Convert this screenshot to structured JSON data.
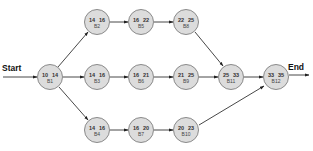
{
  "diagram": {
    "type": "network-diagram",
    "start_label": "Start",
    "end_label": "End",
    "colors": {
      "node_fill": "#dcdcdc",
      "node_stroke": "#8a8a8a",
      "edge": "#333333",
      "text": "#333333"
    },
    "nodes": [
      {
        "id": "B1",
        "left": "10",
        "right": "14",
        "cx": 50,
        "cy": 77
      },
      {
        "id": "B2",
        "left": "14",
        "right": "16",
        "cx": 97,
        "cy": 22
      },
      {
        "id": "B3",
        "left": "14",
        "right": "16",
        "cx": 97,
        "cy": 77
      },
      {
        "id": "B4",
        "left": "14",
        "right": "16",
        "cx": 97,
        "cy": 130
      },
      {
        "id": "B5",
        "left": "16",
        "right": "22",
        "cx": 141,
        "cy": 22
      },
      {
        "id": "B6",
        "left": "16",
        "right": "21",
        "cx": 141,
        "cy": 77
      },
      {
        "id": "B7",
        "left": "16",
        "right": "20",
        "cx": 141,
        "cy": 130
      },
      {
        "id": "B8",
        "left": "22",
        "right": "25",
        "cx": 186,
        "cy": 22
      },
      {
        "id": "B9",
        "left": "21",
        "right": "25",
        "cx": 186,
        "cy": 77
      },
      {
        "id": "B10",
        "left": "20",
        "right": "23",
        "cx": 186,
        "cy": 130
      },
      {
        "id": "B11",
        "left": "25",
        "right": "33",
        "cx": 231,
        "cy": 77
      },
      {
        "id": "B12",
        "left": "33",
        "right": "35",
        "cx": 276,
        "cy": 77
      }
    ],
    "edges": [
      [
        "Start",
        "B1"
      ],
      [
        "B1",
        "B2"
      ],
      [
        "B1",
        "B3"
      ],
      [
        "B1",
        "B4"
      ],
      [
        "B2",
        "B5"
      ],
      [
        "B5",
        "B8"
      ],
      [
        "B8",
        "B11"
      ],
      [
        "B3",
        "B6"
      ],
      [
        "B6",
        "B9"
      ],
      [
        "B9",
        "B11"
      ],
      [
        "B4",
        "B7"
      ],
      [
        "B7",
        "B10"
      ],
      [
        "B10",
        "B12"
      ],
      [
        "B11",
        "B12"
      ],
      [
        "B12",
        "End"
      ]
    ]
  }
}
